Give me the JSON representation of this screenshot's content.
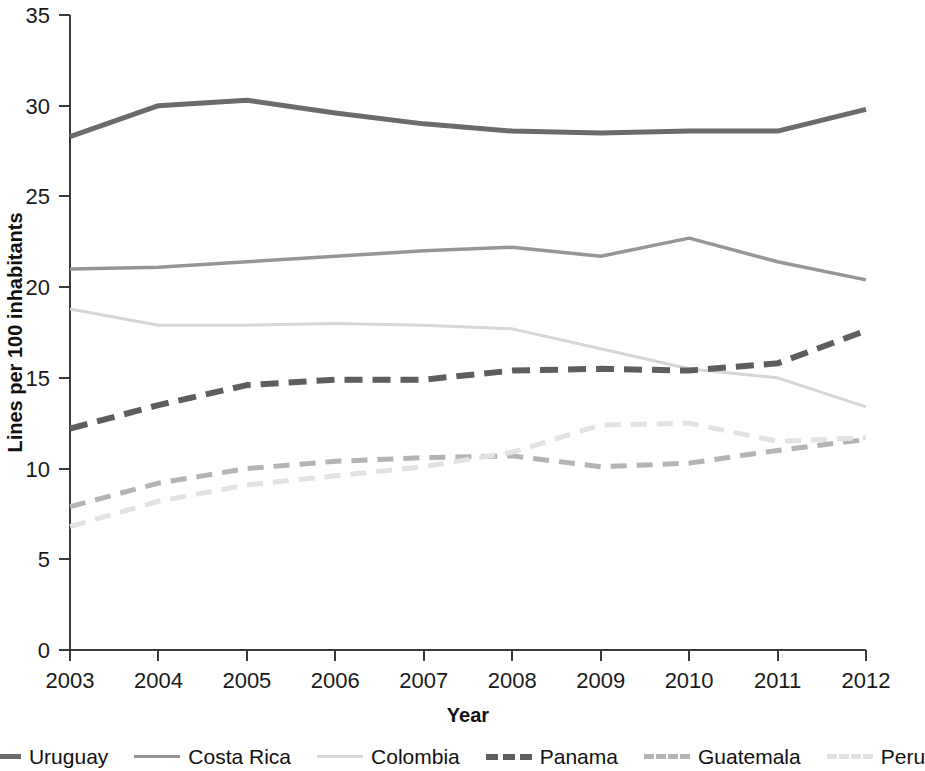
{
  "chart_data": {
    "type": "line",
    "title": "",
    "xlabel": "Year",
    "ylabel": "Lines per 100 inhabitants",
    "x": [
      2003,
      2004,
      2005,
      2006,
      2007,
      2008,
      2009,
      2010,
      2011,
      2012
    ],
    "xticklabels": [
      "2003",
      "2004",
      "2005",
      "2006",
      "2007",
      "2008",
      "2009",
      "2010",
      "2011",
      "2012"
    ],
    "yticks": [
      0,
      5,
      10,
      15,
      20,
      25,
      30,
      35
    ],
    "yticklabels": [
      "0",
      "5",
      "10",
      "15",
      "20",
      "25",
      "30",
      "35"
    ],
    "ylim": [
      0,
      35
    ],
    "xlim": [
      2003,
      2012
    ],
    "grid": false,
    "legend_position": "below",
    "series": [
      {
        "name": "Uruguay",
        "values": [
          28.3,
          30.0,
          30.3,
          29.6,
          29.0,
          28.6,
          28.5,
          28.6,
          28.6,
          29.8
        ],
        "color": "#6b6b6b",
        "width": 5,
        "dash": "none"
      },
      {
        "name": "Costa Rica",
        "values": [
          21.0,
          21.1,
          21.4,
          21.7,
          22.0,
          22.2,
          21.7,
          22.7,
          21.4,
          20.4
        ],
        "color": "#969696",
        "width": 3.5,
        "dash": "none"
      },
      {
        "name": "Colombia",
        "values": [
          18.8,
          17.9,
          17.9,
          18.0,
          17.9,
          17.7,
          16.6,
          15.5,
          15.0,
          13.4
        ],
        "color": "#d6d6d6",
        "width": 3,
        "dash": "none"
      },
      {
        "name": "Panama",
        "values": [
          12.2,
          13.5,
          14.6,
          14.9,
          14.9,
          15.4,
          15.5,
          15.4,
          15.8,
          17.6
        ],
        "color": "#5e5e5e",
        "width": 6,
        "dash": "18 10"
      },
      {
        "name": "Guatemala",
        "values": [
          7.9,
          9.2,
          10.0,
          10.4,
          10.6,
          10.7,
          10.1,
          10.3,
          11.0,
          11.6
        ],
        "color": "#b4b4b4",
        "width": 5,
        "dash": "16 10"
      },
      {
        "name": "Peru",
        "values": [
          6.8,
          8.2,
          9.1,
          9.6,
          10.1,
          10.9,
          12.4,
          12.5,
          11.5,
          11.7
        ],
        "color": "#e2e2e2",
        "width": 5,
        "dash": "16 10"
      }
    ]
  },
  "legend": {
    "items": [
      {
        "label": "Uruguay"
      },
      {
        "label": "Costa Rica"
      },
      {
        "label": "Colombia"
      },
      {
        "label": "Panama"
      },
      {
        "label": "Guatemala"
      },
      {
        "label": "Peru"
      }
    ]
  }
}
